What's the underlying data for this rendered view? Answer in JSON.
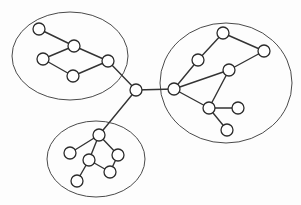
{
  "diagram": {
    "type": "node-link-graph",
    "canvas": {
      "width": 301,
      "height": 205
    },
    "style": {
      "background_color": "#fdfdfd",
      "node_fill": "#ffffff",
      "node_stroke": "#2b2b2b",
      "edge_color": "#333333",
      "cluster_stroke": "#4a4a4a",
      "node_radius": 6
    },
    "clusters": [
      {
        "id": "cluster-top-left",
        "label": "Top-left cluster",
        "cx": 70,
        "cy": 56,
        "rx": 58,
        "ry": 44,
        "node_count": 5
      },
      {
        "id": "cluster-right",
        "label": "Right cluster",
        "cx": 226,
        "cy": 83,
        "rx": 66,
        "ry": 60,
        "node_count": 7
      },
      {
        "id": "cluster-bottom",
        "label": "Bottom cluster",
        "cx": 96,
        "cy": 159,
        "rx": 49,
        "ry": 38,
        "node_count": 6
      }
    ],
    "nodes": [
      {
        "id": "n1",
        "label": "n1",
        "cx": 39,
        "cy": 29,
        "cluster": "cluster-top-left"
      },
      {
        "id": "n2",
        "label": "n2",
        "cx": 74,
        "cy": 46,
        "cluster": "cluster-top-left"
      },
      {
        "id": "n3",
        "label": "n3",
        "cx": 43,
        "cy": 59,
        "cluster": "cluster-top-left"
      },
      {
        "id": "n4",
        "label": "n4",
        "cx": 73,
        "cy": 76,
        "cluster": "cluster-top-left"
      },
      {
        "id": "n5",
        "label": "n5",
        "cx": 108,
        "cy": 61,
        "cluster": "cluster-top-left"
      },
      {
        "id": "hub",
        "label": "hub",
        "cx": 136,
        "cy": 90,
        "cluster": "none"
      },
      {
        "id": "r1",
        "label": "r1",
        "cx": 174,
        "cy": 89,
        "cluster": "cluster-right"
      },
      {
        "id": "r2",
        "label": "r2",
        "cx": 198,
        "cy": 60,
        "cluster": "cluster-right"
      },
      {
        "id": "r3",
        "label": "r3",
        "cx": 223,
        "cy": 33,
        "cluster": "cluster-right"
      },
      {
        "id": "r4",
        "label": "r4",
        "cx": 264,
        "cy": 51,
        "cluster": "cluster-right"
      },
      {
        "id": "r5",
        "label": "r5",
        "cx": 229,
        "cy": 70,
        "cluster": "cluster-right"
      },
      {
        "id": "r6",
        "label": "r6",
        "cx": 209,
        "cy": 108,
        "cluster": "cluster-right"
      },
      {
        "id": "r7",
        "label": "r7",
        "cx": 238,
        "cy": 108,
        "cluster": "cluster-right"
      },
      {
        "id": "r8",
        "label": "r8",
        "cx": 227,
        "cy": 130,
        "cluster": "cluster-right"
      },
      {
        "id": "b1",
        "label": "b1",
        "cx": 99,
        "cy": 135,
        "cluster": "cluster-bottom"
      },
      {
        "id": "b2",
        "label": "b2",
        "cx": 70,
        "cy": 153,
        "cluster": "cluster-bottom"
      },
      {
        "id": "b3",
        "label": "b3",
        "cx": 89,
        "cy": 160,
        "cluster": "cluster-bottom"
      },
      {
        "id": "b4",
        "label": "b4",
        "cx": 118,
        "cy": 155,
        "cluster": "cluster-bottom"
      },
      {
        "id": "b5",
        "label": "b5",
        "cx": 110,
        "cy": 172,
        "cluster": "cluster-bottom"
      },
      {
        "id": "b6",
        "label": "b6",
        "cx": 77,
        "cy": 181,
        "cluster": "cluster-bottom"
      }
    ],
    "edges": [
      {
        "source": "n1",
        "target": "n2"
      },
      {
        "source": "n2",
        "target": "n3"
      },
      {
        "source": "n2",
        "target": "n5"
      },
      {
        "source": "n3",
        "target": "n4"
      },
      {
        "source": "n4",
        "target": "n5"
      },
      {
        "source": "n5",
        "target": "hub"
      },
      {
        "source": "hub",
        "target": "r1"
      },
      {
        "source": "hub",
        "target": "b1"
      },
      {
        "source": "r1",
        "target": "r2"
      },
      {
        "source": "r1",
        "target": "r5"
      },
      {
        "source": "r1",
        "target": "r6"
      },
      {
        "source": "r2",
        "target": "r3"
      },
      {
        "source": "r3",
        "target": "r4"
      },
      {
        "source": "r4",
        "target": "r5"
      },
      {
        "source": "r5",
        "target": "r6"
      },
      {
        "source": "r6",
        "target": "r7"
      },
      {
        "source": "r6",
        "target": "r8"
      },
      {
        "source": "b1",
        "target": "b2"
      },
      {
        "source": "b1",
        "target": "b3"
      },
      {
        "source": "b1",
        "target": "b4"
      },
      {
        "source": "b3",
        "target": "b5"
      },
      {
        "source": "b3",
        "target": "b6"
      },
      {
        "source": "b4",
        "target": "b5"
      }
    ]
  }
}
